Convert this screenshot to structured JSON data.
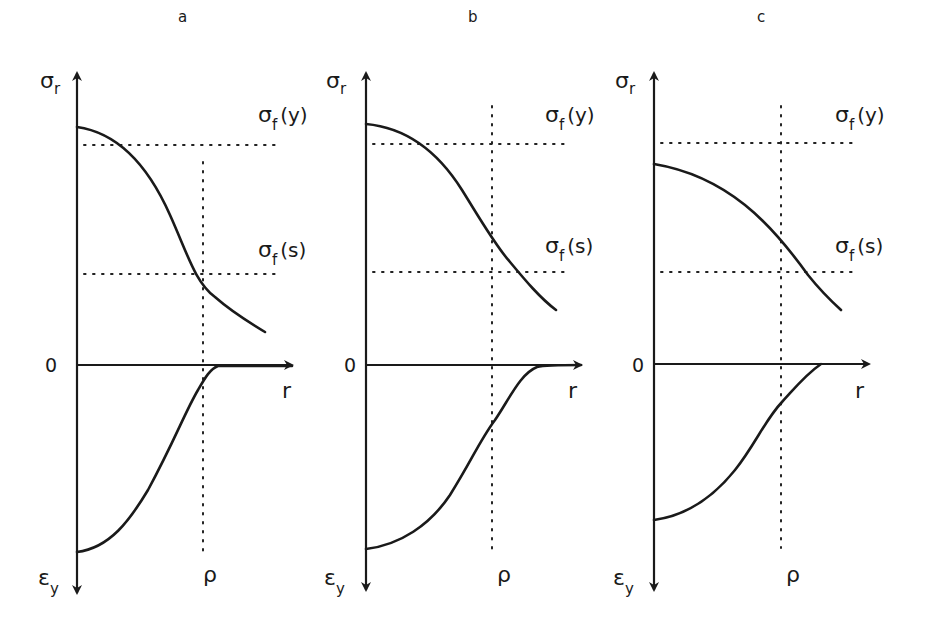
{
  "figure": {
    "colors": {
      "ink": "#1a1a1a",
      "background": "#ffffff"
    },
    "panels": [
      {
        "id": "a",
        "letter": "a",
        "y_axis_top_label": {
          "symbol": "σ",
          "subscript": "r"
        },
        "y_axis_bottom_label": {
          "symbol": "ε",
          "subscript": "y"
        },
        "origin_label": "0",
        "x_axis_label": "r",
        "rho_label": "ρ",
        "threshold_labels": [
          {
            "symbol": "σ",
            "subscript": "f",
            "arg": "(y)"
          },
          {
            "symbol": "σ",
            "subscript": "f",
            "arg": "(s)"
          }
        ],
        "geom": {
          "ax": 77,
          "ay": 365,
          "yTop": 73,
          "yBot": 593,
          "xEnd": 292,
          "rhoX": 203,
          "rhoTop": 162,
          "rhoBot": 552,
          "fy": 145,
          "fs": 274,
          "hEnd": 277,
          "upper": "M77,127 C120,133 150,170 170,215 C188,255 195,282 215,297 C232,312 250,323 265,332",
          "lower": "M77,552 C110,548 130,520 148,490 C175,440 185,412 198,390 C205,378 210,369 218,366 L292,366",
          "labelFy": [
            258,
            122
          ],
          "labelFs": [
            258,
            257
          ],
          "sigmaR": [
            40,
            88
          ],
          "epsY": [
            38,
            585
          ],
          "zero": [
            45,
            372
          ],
          "rLabel": [
            282,
            398
          ],
          "rho": [
            203,
            582
          ],
          "letter": [
            178,
            22
          ]
        }
      },
      {
        "id": "b",
        "letter": "b",
        "y_axis_top_label": {
          "symbol": "σ",
          "subscript": "r"
        },
        "y_axis_bottom_label": {
          "symbol": "ε",
          "subscript": "y"
        },
        "origin_label": "0",
        "x_axis_label": "r",
        "rho_label": "ρ",
        "threshold_labels": [
          {
            "symbol": "σ",
            "subscript": "f",
            "arg": "(y)"
          },
          {
            "symbol": "σ",
            "subscript": "f",
            "arg": "(s)"
          }
        ],
        "geom": {
          "ax": 366,
          "ay": 365,
          "yTop": 73,
          "yBot": 590,
          "xEnd": 581,
          "rhoX": 492,
          "rhoTop": 106,
          "rhoBot": 550,
          "fy": 144,
          "fs": 272,
          "hEnd": 565,
          "upper": "M366,124 C410,128 440,155 462,190 C482,222 495,245 510,262 C525,280 540,298 556,310",
          "lower": "M366,549 C400,545 430,525 450,495 C472,460 480,440 495,420 C510,398 520,374 537,367 C545,365 560,365 581,365",
          "labelFy": [
            545,
            122
          ],
          "labelFs": [
            545,
            253
          ],
          "sigmaR": [
            326,
            88
          ],
          "epsY": [
            324,
            585
          ],
          "zero": [
            344,
            372
          ],
          "rLabel": [
            568,
            398
          ],
          "rho": [
            497,
            582
          ],
          "letter": [
            468,
            22
          ]
        }
      },
      {
        "id": "c",
        "letter": "c",
        "y_axis_top_label": {
          "symbol": "σ",
          "subscript": "r"
        },
        "y_axis_bottom_label": {
          "symbol": "ε",
          "subscript": "y"
        },
        "origin_label": "0",
        "x_axis_label": "r",
        "rho_label": "ρ",
        "threshold_labels": [
          {
            "symbol": "σ",
            "subscript": "f",
            "arg": "(y)"
          },
          {
            "symbol": "σ",
            "subscript": "f",
            "arg": "(s)"
          }
        ],
        "geom": {
          "ax": 654,
          "ay": 364,
          "yTop": 73,
          "yBot": 590,
          "xEnd": 869,
          "rhoX": 781,
          "rhoTop": 106,
          "rhoBot": 548,
          "fy": 143,
          "fs": 272,
          "hEnd": 855,
          "upper": "M654,164 C690,170 720,185 745,205 C770,225 790,250 808,275 C820,290 830,300 841,310",
          "lower": "M654,520 C690,515 715,495 735,470 C755,445 765,420 782,402 C795,388 805,375 821,364",
          "labelFy": [
            835,
            122
          ],
          "labelFs": [
            835,
            253
          ],
          "sigmaR": [
            615,
            88
          ],
          "epsY": [
            613,
            585
          ],
          "zero": [
            632,
            372
          ],
          "rLabel": [
            855,
            398
          ],
          "rho": [
            786,
            582
          ],
          "letter": [
            757,
            22
          ]
        }
      }
    ]
  }
}
